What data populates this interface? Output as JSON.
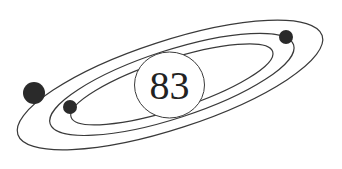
{
  "diagram": {
    "type": "atom-model",
    "nucleus": {
      "label": "83"
    },
    "orbits": 3,
    "electrons": 3,
    "colors": {
      "line": "#3a3a3a",
      "electron": "#2a2a2a",
      "background": "#ffffff"
    }
  }
}
